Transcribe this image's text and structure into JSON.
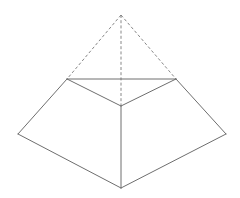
{
  "diagram": {
    "type": "geometry",
    "colors": {
      "background": "#ffffff",
      "solid_edge": "#6e6e6e",
      "dashed_edge": "#7a7a7a"
    },
    "vertices": [
      "apex",
      "top-left",
      "top-right",
      "top-front",
      "bottom-left",
      "bottom-right",
      "bottom-front"
    ],
    "edges": {
      "visible": [
        [
          "top-left",
          "top-right"
        ],
        [
          "top-left",
          "top-front"
        ],
        [
          "top-right",
          "top-front"
        ],
        [
          "top-left",
          "bottom-left"
        ],
        [
          "top-right",
          "bottom-right"
        ],
        [
          "top-front",
          "bottom-front"
        ],
        [
          "bottom-left",
          "bottom-front"
        ],
        [
          "bottom-right",
          "bottom-front"
        ]
      ],
      "dashed": [
        [
          "apex",
          "top-left"
        ],
        [
          "apex",
          "top-right"
        ],
        [
          "apex",
          "top-front"
        ]
      ]
    },
    "labels": []
  }
}
